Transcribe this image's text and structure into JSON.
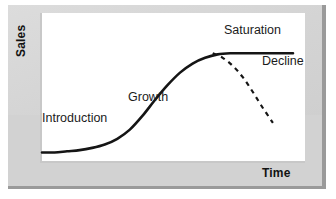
{
  "figure": {
    "title_visible": false,
    "background_color": "#d2d2d2",
    "plot_background_color": "#ffffff",
    "curve_color": "#151515"
  },
  "axes": {
    "y_label": "Sales",
    "x_label": "Time"
  },
  "stage_labels": [
    {
      "key": "introduction",
      "text": "Introduction"
    },
    {
      "key": "growth",
      "text": "Growth"
    },
    {
      "key": "saturation",
      "text": "Saturation"
    },
    {
      "key": "decline",
      "text": "Decline"
    }
  ],
  "chart_data": {
    "type": "line",
    "xlabel": "Time",
    "ylabel": "Sales",
    "xlim": [
      0,
      100
    ],
    "ylim": [
      0,
      100
    ],
    "grid": false,
    "legend": "none",
    "axis_ticks": {
      "x": [],
      "y": []
    },
    "series": [
      {
        "name": "Sales curve",
        "style": "solid",
        "color": "#151515",
        "linewidth": 2.6,
        "x": [
          0,
          5,
          10,
          15,
          20,
          25,
          30,
          35,
          40,
          45,
          50,
          55,
          60,
          65,
          70,
          75,
          80,
          85,
          90,
          95,
          100
        ],
        "y": [
          4,
          4,
          5,
          6,
          8,
          11,
          16,
          24,
          36,
          50,
          63,
          74,
          82,
          87,
          90,
          91,
          91,
          91,
          91,
          91,
          91
        ]
      },
      {
        "name": "Decline (projected)",
        "style": "dashed",
        "color": "#151515",
        "linewidth": 2.2,
        "x": [
          68,
          72,
          76,
          80,
          84,
          88,
          92
        ],
        "y": [
          91,
          87,
          80,
          70,
          57,
          43,
          30
        ]
      }
    ],
    "annotations": [
      {
        "text": "Introduction",
        "x": 5,
        "y": 30,
        "phase": "introduction"
      },
      {
        "text": "Growth",
        "x": 38,
        "y": 44,
        "phase": "growth"
      },
      {
        "text": "Saturation",
        "x": 72,
        "y": 96,
        "phase": "saturation"
      },
      {
        "text": "Decline",
        "x": 86,
        "y": 74,
        "phase": "decline"
      }
    ]
  }
}
